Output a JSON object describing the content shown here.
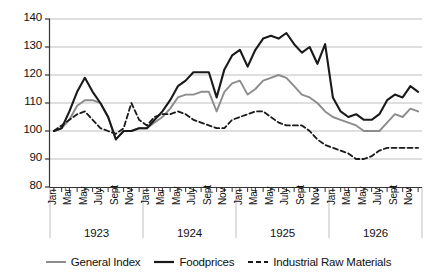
{
  "chart_data": {
    "type": "line",
    "title": "",
    "xlabel": "",
    "ylabel": "",
    "ylim": [
      80,
      140
    ],
    "ytick_values": [
      80,
      90,
      100,
      110,
      120,
      130,
      140
    ],
    "ytick_labels": [
      "80",
      "90",
      "100",
      "110",
      "120",
      "130",
      "140"
    ],
    "grid": true,
    "legend_position": "bottom",
    "years": [
      "1923",
      "1924",
      "1925",
      "1926"
    ],
    "month_tick_labels": [
      "Jan",
      "Mar",
      "May",
      "July",
      "Sept",
      "Nov"
    ],
    "x": [
      "1923-Jan",
      "1923-Feb",
      "1923-Mar",
      "1923-Apr",
      "1923-May",
      "1923-Jun",
      "1923-Jul",
      "1923-Aug",
      "1923-Sep",
      "1923-Oct",
      "1923-Nov",
      "1923-Dec",
      "1924-Jan",
      "1924-Feb",
      "1924-Mar",
      "1924-Apr",
      "1924-May",
      "1924-Jun",
      "1924-Jul",
      "1924-Aug",
      "1924-Sep",
      "1924-Oct",
      "1924-Nov",
      "1924-Dec",
      "1925-Jan",
      "1925-Feb",
      "1925-Mar",
      "1925-Apr",
      "1925-May",
      "1925-Jun",
      "1925-Jul",
      "1925-Aug",
      "1925-Sep",
      "1925-Oct",
      "1925-Nov",
      "1925-Dec",
      "1926-Jan",
      "1926-Feb",
      "1926-Mar",
      "1926-Apr",
      "1926-May",
      "1926-Jun",
      "1926-Jul",
      "1926-Aug",
      "1926-Sep",
      "1926-Oct",
      "1926-Nov",
      "1926-Dec"
    ],
    "series": [
      {
        "name": "General Index",
        "style": "solid",
        "color": "#8c8c8c",
        "values": [
          100,
          101,
          104,
          109,
          111,
          111,
          110,
          105,
          97,
          100,
          100,
          101,
          101,
          103,
          105,
          108,
          112,
          113,
          113,
          114,
          114,
          107,
          114,
          117,
          118,
          113,
          115,
          118,
          119,
          120,
          119,
          116,
          113,
          112,
          110,
          107,
          105,
          104,
          103,
          102,
          100,
          100,
          100,
          103,
          106,
          105,
          108,
          107
        ]
      },
      {
        "name": "Foodprices",
        "style": "solid",
        "color": "#1a1a1a",
        "values": [
          100,
          101,
          107,
          114,
          119,
          114,
          110,
          105,
          97,
          100,
          100,
          101,
          101,
          104,
          107,
          111,
          116,
          118,
          121,
          121,
          121,
          112,
          122,
          127,
          129,
          123,
          129,
          133,
          134,
          133,
          135,
          131,
          128,
          130,
          124,
          131,
          112,
          107,
          105,
          106,
          104,
          104,
          106,
          111,
          113,
          112,
          116,
          114
        ]
      },
      {
        "name": "Industrial Raw Materials",
        "style": "dashed",
        "color": "#1a1a1a",
        "values": [
          100,
          102,
          104,
          106,
          107,
          104,
          101,
          100,
          99,
          101,
          110,
          104,
          102,
          105,
          106,
          106,
          107,
          106,
          104,
          103,
          102,
          101,
          101,
          104,
          105,
          106,
          107,
          107,
          105,
          103,
          102,
          102,
          102,
          100,
          97,
          95,
          94,
          93,
          92,
          90,
          90,
          91,
          93,
          94,
          94,
          94,
          94,
          94
        ]
      }
    ]
  },
  "legend": {
    "entries": [
      {
        "label": "General Index"
      },
      {
        "label": "Foodprices"
      },
      {
        "label": "Industrial Raw Materials"
      }
    ]
  },
  "colors": {
    "general_index": "#8c8c8c",
    "foodprices": "#1a1a1a",
    "industrial": "#1a1a1a",
    "grid": "#b8b8b8",
    "axis": "#333333"
  }
}
